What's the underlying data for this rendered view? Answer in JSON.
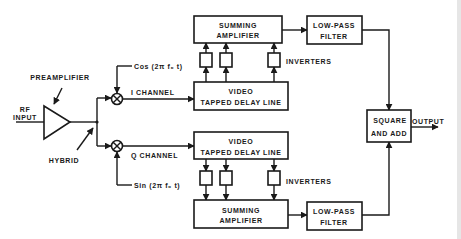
{
  "diagram": {
    "title": "",
    "input": {
      "line1": "RF",
      "line2": "INPUT"
    },
    "preamplifier": "PREAMPLIFIER",
    "hybrid": "HYBRID",
    "i_channel": {
      "reference": "Cos (2π f₀ t)",
      "label": "I CHANNEL",
      "delay_line": {
        "line1": "VIDEO",
        "line2": "TAPPED DELAY LINE"
      },
      "inverters": "INVERTERS",
      "summing": {
        "line1": "SUMMING",
        "line2": "AMPLIFIER"
      },
      "filter": {
        "line1": "LOW-PASS",
        "line2": "FILTER"
      }
    },
    "q_channel": {
      "reference": "Sin (2π f₀ t)",
      "label": "Q CHANNEL",
      "delay_line": {
        "line1": "VIDEO",
        "line2": "TAPPED DELAY LINE"
      },
      "inverters": "INVERTERS",
      "summing": {
        "line1": "SUMMING",
        "line2": "AMPLIFIER"
      },
      "filter": {
        "line1": "LOW-PASS",
        "line2": "FILTER"
      }
    },
    "combiner": {
      "line1": "SQUARE",
      "line2": "AND ADD"
    },
    "output": "OUTPUT",
    "colors": {
      "ink": "#1a1a1a",
      "background": "#ffffff"
    }
  }
}
